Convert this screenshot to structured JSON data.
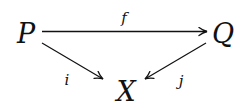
{
  "diagram": {
    "type": "commutative-diagram",
    "nodes": {
      "P": {
        "label": "P",
        "x": 26,
        "y": 32
      },
      "Q": {
        "label": "Q",
        "x": 222,
        "y": 32
      },
      "X": {
        "label": "X",
        "x": 126,
        "y": 90
      }
    },
    "arrows": {
      "f": {
        "label": "f",
        "from": "P",
        "to": "Q",
        "label_x": 124,
        "label_y": 17
      },
      "i": {
        "label": "i",
        "from": "P",
        "to": "X",
        "label_x": 67,
        "label_y": 80
      },
      "j": {
        "label": "j",
        "from": "Q",
        "to": "X",
        "label_x": 181,
        "label_y": 80
      }
    },
    "colors": {
      "ink": "#111111",
      "background": "#ffffff"
    }
  }
}
